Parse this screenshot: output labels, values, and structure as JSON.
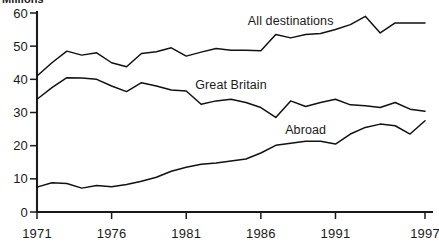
{
  "chart": {
    "title": "Millions",
    "title_note": "partially cropped at top edge of image"
  },
  "chart_data": {
    "type": "line",
    "title": "Millions",
    "xlabel": "",
    "ylabel": "Millions",
    "xlim": [
      1971,
      1997
    ],
    "ylim": [
      0,
      60
    ],
    "yticks": [
      0,
      10,
      20,
      30,
      40,
      50,
      60
    ],
    "ytick_labels": [
      "0",
      "10",
      "20",
      "30",
      "40",
      "50",
      "60"
    ],
    "xticks": [
      1971,
      1976,
      1981,
      1986,
      1991,
      1997
    ],
    "xtick_labels": [
      "1971",
      "1976",
      "1981",
      "1986",
      "1991",
      "1997"
    ],
    "grid": false,
    "legend": "inline-labels",
    "x": [
      1971,
      1972,
      1973,
      1974,
      1975,
      1976,
      1977,
      1978,
      1979,
      1980,
      1981,
      1982,
      1983,
      1984,
      1985,
      1986,
      1987,
      1988,
      1989,
      1990,
      1991,
      1992,
      1993,
      1994,
      1995,
      1996,
      1997
    ],
    "series": [
      {
        "name": "All destinations",
        "color": "#111111",
        "label_x": 1988,
        "label_y": 56.5,
        "values": [
          41.0,
          45.0,
          48.5,
          47.3,
          48.0,
          45.0,
          43.8,
          47.8,
          48.3,
          49.5,
          47.0,
          48.2,
          49.3,
          48.8,
          48.8,
          48.6,
          53.5,
          52.5,
          53.5,
          53.8,
          55.0,
          56.5,
          59.0,
          54.0,
          57.0,
          57.0,
          57.0
        ]
      },
      {
        "name": "Great Britain",
        "color": "#111111",
        "label_x": 1984,
        "label_y": 37.0,
        "values": [
          34.0,
          37.5,
          40.5,
          40.4,
          40.0,
          38.0,
          36.3,
          39.0,
          38.0,
          36.8,
          36.5,
          32.5,
          33.5,
          34.0,
          33.0,
          31.5,
          28.5,
          33.5,
          31.8,
          33.0,
          34.0,
          32.3,
          32.0,
          31.5,
          33.0,
          31.0,
          30.4
        ]
      },
      {
        "name": "Abroad",
        "color": "#111111",
        "label_x": 1989,
        "label_y": 23.5,
        "values": [
          7.5,
          8.8,
          8.6,
          7.2,
          8.0,
          7.6,
          8.3,
          9.3,
          10.5,
          12.3,
          13.5,
          14.4,
          14.8,
          15.4,
          16.0,
          17.8,
          20.1,
          20.7,
          21.3,
          21.3,
          20.5,
          23.5,
          25.5,
          26.5,
          26.0,
          23.5,
          27.5
        ]
      }
    ],
    "series_labels": [
      "All destinations",
      "Great Britain",
      "Abroad"
    ]
  }
}
